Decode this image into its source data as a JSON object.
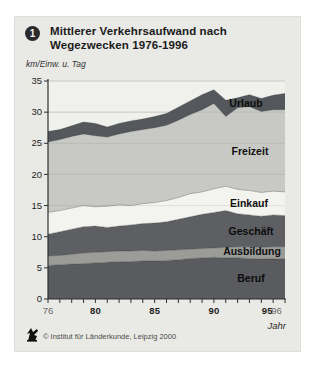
{
  "header": {
    "badge": "1",
    "title_line1": "Mittlerer Verkehrsaufwand nach",
    "title_line2": "Wegezwecken 1976-1996"
  },
  "axes": {
    "y_unit_label": "km/Einw. u. Tag",
    "x_axis_label": "Jahr"
  },
  "footer": {
    "logo_icon": "ifl-logo",
    "credit": "© Institut für Länderkunde, Leipzig 2000"
  },
  "colors": {
    "card_bg": "#e9e9e5",
    "plot_bg": "#f0f0ec",
    "grid": "#d9d9d3",
    "axis": "#2f2f2f",
    "tick_label": "#1e1e1e",
    "muted_tick_label": "#6a6a6a"
  },
  "chart_data": {
    "type": "area",
    "stacked": true,
    "title": "Mittlerer Verkehrsaufwand nach Wegezwecken 1976-1996",
    "xlabel": "Jahr",
    "ylabel": "km/Einw. u. Tag",
    "xlim": [
      1976,
      1996
    ],
    "ylim": [
      0,
      35
    ],
    "y_ticks": [
      0,
      5,
      10,
      15,
      20,
      25,
      30,
      35
    ],
    "grid": true,
    "x_minor_tick_step": 1,
    "x_major_ticks": [
      {
        "year": 1976,
        "label": "76",
        "bold": false
      },
      {
        "year": 1980,
        "label": "80",
        "bold": true
      },
      {
        "year": 1985,
        "label": "85",
        "bold": true
      },
      {
        "year": 1990,
        "label": "90",
        "bold": true
      },
      {
        "year": 1995,
        "label": "95",
        "bold": true
      },
      {
        "year": 1996,
        "label": "96",
        "bold": false
      }
    ],
    "years": [
      1976,
      1977,
      1978,
      1979,
      1980,
      1981,
      1982,
      1983,
      1984,
      1985,
      1986,
      1987,
      1988,
      1989,
      1990,
      1991,
      1992,
      1993,
      1994,
      1995,
      1996
    ],
    "series": [
      {
        "name": "Beruf",
        "color": "#595b5e",
        "values": [
          5.4,
          5.5,
          5.6,
          5.7,
          5.8,
          5.9,
          6.0,
          6.0,
          6.1,
          6.1,
          6.2,
          6.3,
          6.5,
          6.6,
          6.7,
          6.6,
          6.6,
          6.5,
          6.4,
          6.4,
          6.5
        ]
      },
      {
        "name": "Ausbildung",
        "color": "#9b9c98",
        "values": [
          1.5,
          1.5,
          1.6,
          1.7,
          1.7,
          1.7,
          1.7,
          1.7,
          1.7,
          1.6,
          1.6,
          1.6,
          1.5,
          1.5,
          1.5,
          1.7,
          1.8,
          1.9,
          1.9,
          2.0,
          1.9
        ]
      },
      {
        "name": "Geschäft",
        "color": "#5d5f63",
        "values": [
          3.5,
          3.8,
          4.0,
          4.2,
          4.2,
          3.9,
          4.0,
          4.2,
          4.3,
          4.5,
          4.6,
          4.9,
          5.2,
          5.5,
          5.7,
          5.9,
          5.3,
          5.1,
          5.0,
          5.1,
          5.0
        ]
      },
      {
        "name": "Einkauf",
        "color": "#f3f3ef",
        "values": [
          3.5,
          3.4,
          3.4,
          3.4,
          3.1,
          3.4,
          3.4,
          3.1,
          3.2,
          3.3,
          3.4,
          3.5,
          3.7,
          3.6,
          3.8,
          3.9,
          3.9,
          3.9,
          3.8,
          3.8,
          3.8
        ]
      },
      {
        "name": "Freizeit",
        "color": "#c8c9c4",
        "values": [
          11.3,
          11.4,
          11.5,
          11.5,
          11.4,
          11.1,
          11.4,
          11.9,
          11.9,
          12.0,
          12.1,
          12.4,
          12.7,
          13.2,
          13.7,
          11.2,
          13.1,
          13.5,
          13.0,
          13.1,
          13.2
        ]
      },
      {
        "name": "Urlaub",
        "color": "#54575b",
        "values": [
          1.7,
          1.6,
          1.7,
          1.9,
          2.0,
          1.6,
          1.7,
          1.7,
          1.7,
          1.8,
          1.9,
          2.1,
          2.2,
          2.4,
          2.2,
          2.6,
          1.6,
          1.9,
          2.1,
          2.3,
          2.6
        ]
      }
    ],
    "legend_position": "labels-on-bands"
  }
}
